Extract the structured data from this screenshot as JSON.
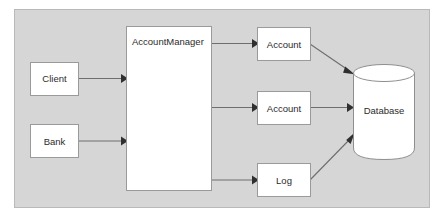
{
  "diagram": {
    "background_color": "#d6d6d6",
    "node_fill": "#ffffff",
    "node_border": "#9a9a9a",
    "edge_color": "#6e6e6e",
    "nodes": {
      "client": {
        "label": "Client",
        "shape": "rectangle"
      },
      "bank": {
        "label": "Bank",
        "shape": "rectangle"
      },
      "account_manager": {
        "label": "AccountManager",
        "shape": "rectangle"
      },
      "account_top": {
        "label": "Account",
        "shape": "rectangle"
      },
      "account_middle": {
        "label": "Account",
        "shape": "rectangle"
      },
      "log": {
        "label": "Log",
        "shape": "rectangle"
      },
      "database": {
        "label": "Database",
        "shape": "cylinder"
      }
    },
    "edges": [
      {
        "from": "client",
        "to": "account_manager",
        "style": "arrow"
      },
      {
        "from": "bank",
        "to": "account_manager",
        "style": "arrow"
      },
      {
        "from": "account_manager",
        "to": "account_top",
        "style": "arrow"
      },
      {
        "from": "account_manager",
        "to": "account_middle",
        "style": "arrow"
      },
      {
        "from": "account_manager",
        "to": "log",
        "style": "arrow"
      },
      {
        "from": "account_top",
        "to": "database",
        "style": "arrow"
      },
      {
        "from": "account_middle",
        "to": "database",
        "style": "arrow"
      },
      {
        "from": "log",
        "to": "database",
        "style": "arrow"
      }
    ]
  }
}
